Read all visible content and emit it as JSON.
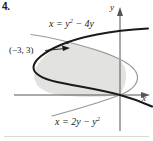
{
  "figure": {
    "problem_number": "4.",
    "labels": {
      "upper_curve_equation_html": "x = y<sup>2</sup> &minus; 4y",
      "lower_curve_equation_html": "x = 2y &minus; y<sup>2</sup>",
      "intersection_point": "(−3, 3)",
      "axis_y": "y",
      "axis_x": "x"
    },
    "colors": {
      "upper_curve": "#1a1a1a",
      "lower_curve": "#999999",
      "shaded_region": "#e2e2e0",
      "axes": "#555555",
      "text": "#1a1a1a",
      "background": "#ffffff",
      "bottom_rule": "#d8d8d8"
    }
  },
  "chart_data": {
    "type": "line",
    "title": "",
    "xlabel": "x",
    "ylabel": "y",
    "grid": false,
    "legend": "none",
    "xlim": [
      -5.5,
      1.5
    ],
    "ylim": [
      -1.5,
      5.5
    ],
    "origin_px": [
      120,
      95
    ],
    "scale_px_per_unit": {
      "x": 17.5,
      "y": 17.5
    },
    "annotations": [
      {
        "text": "(−3, 3)",
        "x": -3,
        "y": 3,
        "type": "point-label-with-arrow"
      }
    ],
    "series": [
      {
        "name": "x = y^2 - 4y",
        "equation": "x = y^2 - 4y",
        "color": "#1a1a1a",
        "style": "solid-thick",
        "parameter": "y",
        "vertex": [
          -4,
          2
        ],
        "points": [
          {
            "y": -0.8,
            "x": 3.84
          },
          {
            "y": 0.0,
            "x": 0.0
          },
          {
            "y": 1.0,
            "x": -3.0
          },
          {
            "y": 2.0,
            "x": -4.0
          },
          {
            "y": 3.0,
            "x": -3.0
          },
          {
            "y": 4.0,
            "x": 0.0
          },
          {
            "y": 4.6,
            "x": 2.76
          }
        ]
      },
      {
        "name": "x = 2y - y^2",
        "equation": "x = 2y - y^2",
        "color": "#999999",
        "style": "solid-thin",
        "parameter": "y",
        "vertex": [
          1,
          1
        ],
        "points": [
          {
            "y": -1.2,
            "x": -3.84
          },
          {
            "y": 0.0,
            "x": 0.0
          },
          {
            "y": 1.0,
            "x": 1.0
          },
          {
            "y": 2.0,
            "x": 0.0
          },
          {
            "y": 3.0,
            "x": -3.0
          },
          {
            "y": 3.8,
            "x": -6.84
          }
        ]
      }
    ],
    "shaded_region": {
      "between": [
        "x = 2y - y^2",
        "x = y^2 - 4y"
      ],
      "y_from": 0,
      "y_to": 3,
      "fill": "#e2e2e0"
    },
    "intersections": [
      {
        "x": 0,
        "y": 0
      },
      {
        "x": -3,
        "y": 3
      }
    ]
  }
}
